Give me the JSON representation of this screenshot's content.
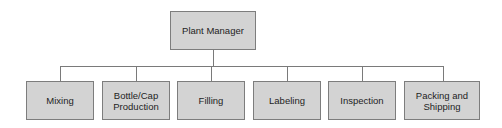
{
  "org_chart": {
    "root": {
      "label": "Plant Manager"
    },
    "children": [
      {
        "label": "Mixing"
      },
      {
        "label": "Bottle/Cap Production"
      },
      {
        "label": "Filling"
      },
      {
        "label": "Labeling"
      },
      {
        "label": "Inspection"
      },
      {
        "label": "Packing and Shipping"
      }
    ]
  },
  "colors": {
    "box_fill": "#d3d3d3",
    "box_border": "#7d7d7d",
    "connector": "#7a7a7a",
    "text": "#1e1e1e"
  }
}
